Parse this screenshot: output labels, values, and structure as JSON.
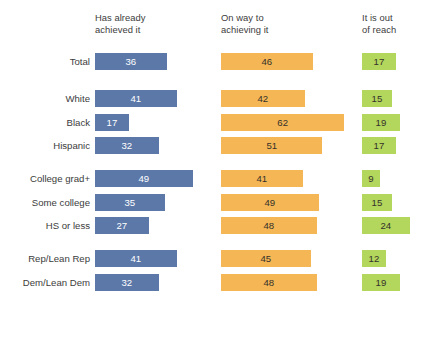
{
  "chart_data": {
    "type": "bar",
    "orientation": "horizontal",
    "layout": "grouped-panels",
    "title": "",
    "xlabel": "",
    "ylabel": "",
    "xlim": [
      0,
      62
    ],
    "grid": false,
    "legend_position": "top",
    "value_suffix": "%",
    "series": [
      {
        "name": "Has already achieved it",
        "color": "#5b78a8",
        "values": [
          36,
          41,
          17,
          32,
          49,
          35,
          27,
          41,
          32
        ]
      },
      {
        "name": "On way to achieving it",
        "color": "#f5b755",
        "values": [
          46,
          42,
          62,
          51,
          41,
          49,
          48,
          45,
          48
        ]
      },
      {
        "name": "It is out of reach",
        "color": "#b3d65c",
        "values": [
          17,
          15,
          19,
          17,
          9,
          15,
          24,
          12,
          19
        ]
      }
    ],
    "categories": [
      "Total",
      "White",
      "Black",
      "Hispanic",
      "College grad+",
      "Some college",
      "HS or less",
      "Rep/Lean Rep",
      "Dem/Lean Dem"
    ],
    "groups": [
      {
        "rows": [
          "Total"
        ]
      },
      {
        "rows": [
          "White",
          "Black",
          "Hispanic"
        ]
      },
      {
        "rows": [
          "College grad+",
          "Some college",
          "HS or less"
        ]
      },
      {
        "rows": [
          "Rep/Lean Rep",
          "Dem/Lean Dem"
        ]
      }
    ]
  },
  "columns": [
    {
      "id": "achieved",
      "header": "Has already\nachieved it",
      "color": "#5b78a8"
    },
    {
      "id": "on-way",
      "header": "On way to\nachieving it",
      "color": "#f5b755"
    },
    {
      "id": "out-of-reach",
      "header": "It is out\nof reach",
      "color": "#b3d65c"
    }
  ],
  "rows": [
    {
      "group": 0,
      "label": "Total",
      "values": [
        36,
        46,
        17
      ]
    },
    {
      "group": 1,
      "label": "White",
      "values": [
        41,
        42,
        15
      ]
    },
    {
      "group": 1,
      "label": "Black",
      "values": [
        17,
        62,
        19
      ]
    },
    {
      "group": 1,
      "label": "Hispanic",
      "values": [
        32,
        51,
        17
      ]
    },
    {
      "group": 2,
      "label": "College grad+",
      "values": [
        49,
        41,
        9
      ]
    },
    {
      "group": 2,
      "label": "Some college",
      "values": [
        35,
        49,
        15
      ]
    },
    {
      "group": 2,
      "label": "HS or less",
      "values": [
        27,
        48,
        24
      ]
    },
    {
      "group": 3,
      "label": "Rep/Lean Rep",
      "values": [
        41,
        45,
        12
      ]
    },
    {
      "group": 3,
      "label": "Dem/Lean Dem",
      "values": [
        32,
        48,
        19
      ]
    }
  ],
  "scale": {
    "px_per_unit": 1.99,
    "column_origins_px": [
      95,
      221,
      362
    ]
  }
}
